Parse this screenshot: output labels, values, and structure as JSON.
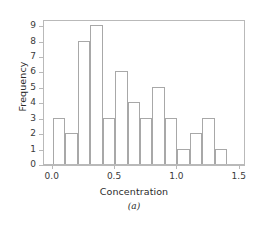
{
  "chart_data": {
    "type": "bar",
    "title": "",
    "subtitle": "",
    "panel_label": "(a)",
    "xlabel": "Concentration",
    "ylabel": "Frequency",
    "bin_width": 0.1,
    "bin_starts": [
      0.0,
      0.1,
      0.2,
      0.3,
      0.4,
      0.5,
      0.6,
      0.7,
      0.8,
      0.9,
      1.0,
      1.1,
      1.2,
      1.3
    ],
    "categories": [
      "0.0-0.1",
      "0.1-0.2",
      "0.2-0.3",
      "0.3-0.4",
      "0.4-0.5",
      "0.5-0.6",
      "0.6-0.7",
      "0.7-0.8",
      "0.8-0.9",
      "0.9-1.0",
      "1.0-1.1",
      "1.1-1.2",
      "1.2-1.3",
      "1.3-1.4"
    ],
    "values": [
      3,
      2,
      8,
      9,
      3,
      6,
      4,
      3,
      5,
      3,
      1,
      2,
      3,
      1
    ],
    "xlim": [
      -0.07,
      1.55
    ],
    "ylim": [
      0,
      9.4
    ],
    "xticks": [
      0.0,
      0.5,
      1.0,
      1.5
    ],
    "xtick_labels": [
      "0.0",
      "0.5",
      "1.0",
      "1.5"
    ],
    "yticks": [
      0,
      1,
      2,
      3,
      4,
      5,
      6,
      7,
      8,
      9
    ],
    "ytick_labels": [
      "0",
      "1",
      "2",
      "3",
      "4",
      "5",
      "6",
      "7",
      "8",
      "9"
    ],
    "grid": false,
    "legend": null,
    "bar_fill_color": "#ffffff",
    "bar_edge_color": "#a8a8a8",
    "axis_color": "#b9b9b9",
    "text_color": "#2b2b2b",
    "background_color": "#ffffff"
  }
}
